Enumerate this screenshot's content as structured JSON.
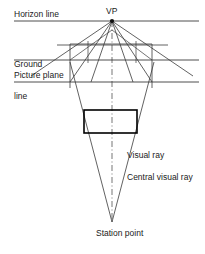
{
  "figure": {
    "background_color": "#ffffff",
    "line_color": "#3a3a3a",
    "bold_line_color": "#000000",
    "text_color": "#1a1a1a",
    "width": 205,
    "height": 254
  },
  "labels": {
    "horizon_line": "Horizon line",
    "vanishing_point": "VP",
    "ground_line_1": "Ground",
    "ground_line_2": "line",
    "picture_plane": "Picture plane",
    "visual_ray": "Visual ray",
    "central_visual_ray": "Central visual ray",
    "station_point": "Station point"
  },
  "geometry": {
    "vanishing_point": {
      "x": 112,
      "y": 21
    },
    "station_point": {
      "x": 112,
      "y": 222
    },
    "horizon_line": {
      "x1": 14,
      "y1": 21,
      "x2": 199,
      "y2": 21
    },
    "ground_line": {
      "x1": 14,
      "y1": 60,
      "x2": 199,
      "y2": 60
    },
    "upper_grid_line": {
      "x1": 57,
      "y1": 45,
      "x2": 168,
      "y2": 45
    },
    "picture_plane_line": {
      "x1": 14,
      "y1": 82,
      "x2": 199,
      "y2": 82
    },
    "grid_box": {
      "left": 70,
      "right": 152,
      "top": 44,
      "bottom": 82
    },
    "object_rectangle": {
      "left": 84,
      "top": 110,
      "right": 137,
      "bottom": 133
    },
    "vp_rays": [
      {
        "x2": 31,
        "y2": 76
      },
      {
        "x2": 70,
        "y2": 82
      },
      {
        "x2": 91,
        "y2": 82
      },
      {
        "x2": 133,
        "y2": 82
      },
      {
        "x2": 152,
        "y2": 82
      },
      {
        "x2": 193,
        "y2": 76
      }
    ],
    "visual_rays": [
      {
        "x1": 70,
        "y1": 62,
        "x2": 112,
        "y2": 222
      },
      {
        "x1": 154,
        "y1": 62,
        "x2": 112,
        "y2": 222
      }
    ],
    "central_visual_ray": {
      "x1": 112,
      "y1": 21,
      "x2": 112,
      "y2": 222
    }
  }
}
